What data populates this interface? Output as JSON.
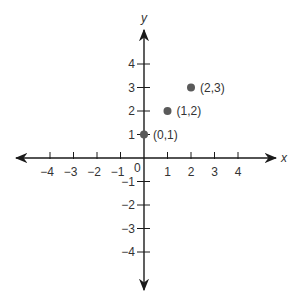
{
  "chart_data": {
    "type": "scatter",
    "title": "",
    "xlabel": "x",
    "ylabel": "y",
    "xlim": [
      -5,
      5
    ],
    "ylim": [
      -5,
      5
    ],
    "grid": false,
    "origin_label": "0",
    "x_ticks": [
      -4,
      -3,
      -2,
      -1,
      1,
      2,
      3,
      4
    ],
    "x_tick_labels": [
      "−4",
      "−3",
      "−2",
      "−1",
      "1",
      "2",
      "3",
      "4"
    ],
    "y_ticks": [
      4,
      3,
      2,
      1,
      -1,
      -2,
      -3,
      -4
    ],
    "y_tick_labels": [
      "4",
      "3",
      "2",
      "1",
      "−1",
      "−2",
      "−3",
      "−4"
    ],
    "series": [
      {
        "name": "points",
        "points": [
          {
            "x": 0,
            "y": 1,
            "label": "(0,1)"
          },
          {
            "x": 1,
            "y": 2,
            "label": "(1,2)"
          },
          {
            "x": 2,
            "y": 3,
            "label": "(2,3)"
          }
        ]
      }
    ]
  },
  "style": {
    "axis_color": "#1a1a1a",
    "point_color": "#5a5a5a",
    "text_color": "#333333"
  }
}
